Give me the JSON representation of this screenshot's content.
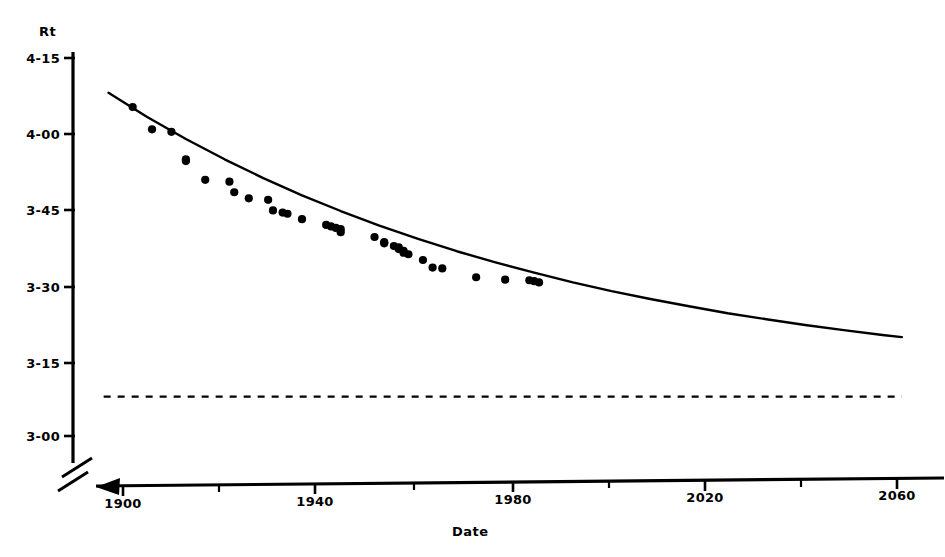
{
  "chart_data": {
    "type": "scatter",
    "title": "",
    "subtitle": "",
    "xlabel": "Date",
    "ylabel": "Rt",
    "grid": false,
    "legend": "none",
    "xlim": [
      1895,
      2062
    ],
    "ylim": [
      2.97,
      4.18
    ],
    "x_ticks_major": [
      1900,
      1940,
      1980,
      2020,
      2060
    ],
    "x_ticks_major_labels": [
      "1900",
      "1940",
      "1980",
      "2020",
      "2060"
    ],
    "x_ticks_minor": [
      1920,
      1960,
      2000,
      2040
    ],
    "y_ticks": [
      4.25,
      4.0,
      3.75,
      3.5,
      3.25,
      3.0
    ],
    "y_tick_labels": [
      "4-15",
      "4-00",
      "3-45",
      "3-30",
      "3-15",
      "3-00"
    ],
    "y_tick_note": "Labels are in minutes-seconds notation: 4-15 means 4 min 15 s = 4.25 min",
    "axis_break_x": true,
    "axis_break_y": true,
    "series": [
      {
        "name": "observed records",
        "type": "scatter",
        "marker": "filled-circle",
        "color": "#000000",
        "points": [
          [
            1902,
            4.088
          ],
          [
            1906,
            4.014
          ],
          [
            1910,
            4.006
          ],
          [
            1913,
            3.915
          ],
          [
            1913,
            3.909
          ],
          [
            1917,
            3.847
          ],
          [
            1922,
            3.841
          ],
          [
            1923,
            3.806
          ],
          [
            1926,
            3.786
          ],
          [
            1930,
            3.781
          ],
          [
            1931,
            3.746
          ],
          [
            1933,
            3.739
          ],
          [
            1934,
            3.735
          ],
          [
            1937,
            3.717
          ],
          [
            1942,
            3.698
          ],
          [
            1943,
            3.693
          ],
          [
            1944,
            3.688
          ],
          [
            1945,
            3.684
          ],
          [
            1945,
            3.674
          ],
          [
            1952,
            3.658
          ],
          [
            1954,
            3.641
          ],
          [
            1954,
            3.637
          ],
          [
            1956,
            3.628
          ],
          [
            1957,
            3.624
          ],
          [
            1957,
            3.618
          ],
          [
            1958,
            3.612
          ],
          [
            1958,
            3.606
          ],
          [
            1959,
            3.601
          ],
          [
            1962,
            3.582
          ],
          [
            1964,
            3.557
          ],
          [
            1966,
            3.554
          ],
          [
            1973,
            3.525
          ],
          [
            1979,
            3.517
          ],
          [
            1984,
            3.515
          ],
          [
            1985,
            3.512
          ],
          [
            1986,
            3.508
          ]
        ]
      },
      {
        "name": "fitted exponential trend",
        "type": "line",
        "style": "solid",
        "color": "#000000",
        "points": [
          [
            1897,
            4.135
          ],
          [
            1905,
            4.055
          ],
          [
            1913,
            3.982
          ],
          [
            1921,
            3.915
          ],
          [
            1929,
            3.853
          ],
          [
            1937,
            3.796
          ],
          [
            1945,
            3.744
          ],
          [
            1953,
            3.696
          ],
          [
            1961,
            3.652
          ],
          [
            1969,
            3.611
          ],
          [
            1977,
            3.574
          ],
          [
            1985,
            3.54
          ],
          [
            1993,
            3.508
          ],
          [
            2001,
            3.479
          ],
          [
            2009,
            3.453
          ],
          [
            2017,
            3.429
          ],
          [
            2025,
            3.406
          ],
          [
            2033,
            3.386
          ],
          [
            2041,
            3.367
          ],
          [
            2049,
            3.35
          ],
          [
            2057,
            3.334
          ],
          [
            2061,
            3.327
          ]
        ]
      },
      {
        "name": "asymptote",
        "type": "line",
        "style": "dashed",
        "color": "#000000",
        "value": 3.13,
        "points": [
          [
            1896,
            3.13
          ],
          [
            2061,
            3.13
          ]
        ]
      }
    ]
  },
  "annotations": {
    "y_axis_break_symbol": "//",
    "x_axis_break_symbol": "//"
  }
}
